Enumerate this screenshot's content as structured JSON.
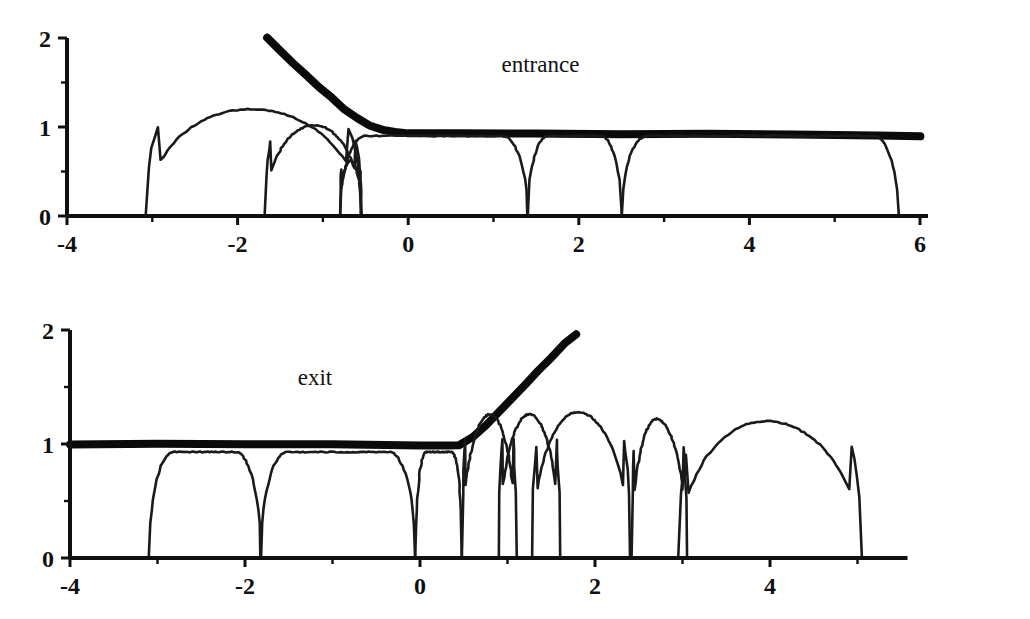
{
  "figure": {
    "background_color": "#ffffff",
    "ink_color": "#101010",
    "width": 1030,
    "height": 619
  },
  "chart_data": [
    {
      "type": "line",
      "title": "",
      "annotation": "entrance",
      "annotation_x": 1.55,
      "annotation_y": 1.62,
      "xlabel": "",
      "ylabel": "",
      "xlim": [
        -4,
        6
      ],
      "ylim": [
        0,
        2
      ],
      "grid": false,
      "legend": "none",
      "xticks": [
        -4,
        -3,
        -2,
        -1,
        0,
        1,
        2,
        3,
        4,
        5,
        6
      ],
      "xticklabels": [
        "-4",
        "",
        "-2",
        "",
        "0",
        "",
        "2",
        "",
        "4",
        "",
        "6"
      ],
      "yticks": [
        0,
        0.5,
        1,
        1.5,
        2
      ],
      "yticklabels": [
        "0",
        "",
        "1",
        "",
        "2"
      ],
      "series": [
        {
          "name": "free-surface-envelope",
          "style": "thick",
          "points": [
            [
              -1.65,
              2.0
            ],
            [
              -1.5,
              1.86
            ],
            [
              -1.35,
              1.72
            ],
            [
              -1.2,
              1.58
            ],
            [
              -1.05,
              1.45
            ],
            [
              -0.9,
              1.33
            ],
            [
              -0.75,
              1.2
            ],
            [
              -0.6,
              1.1
            ],
            [
              -0.45,
              1.02
            ],
            [
              -0.3,
              0.965
            ],
            [
              -0.15,
              0.94
            ],
            [
              0.0,
              0.93
            ],
            [
              0.6,
              0.928
            ],
            [
              1.5,
              0.925
            ],
            [
              2.5,
              0.922
            ],
            [
              3.5,
              0.918
            ],
            [
              4.5,
              0.912
            ],
            [
              5.5,
              0.905
            ],
            [
              6.0,
              0.9
            ]
          ]
        },
        {
          "name": "bubble-1",
          "style": "arc",
          "x_left": -3.08,
          "x_right": -0.55,
          "peak_x": -1.85,
          "peak_y": 1.2
        },
        {
          "name": "bubble-2",
          "style": "arc",
          "x_left": -1.68,
          "x_right": -0.55,
          "peak_x": -1.1,
          "peak_y": 1.02
        },
        {
          "name": "bubble-3",
          "style": "arc",
          "x_left": -0.8,
          "x_right": -0.55,
          "peak_x": -0.68,
          "peak_y": 0.62
        },
        {
          "name": "plateau-1",
          "style": "plateau",
          "x_left": -0.8,
          "x_right": 1.4,
          "top_y": 0.9
        },
        {
          "name": "plateau-2",
          "style": "plateau",
          "x_left": 1.4,
          "x_right": 2.5,
          "top_y": 0.9
        },
        {
          "name": "plateau-3",
          "style": "plateau",
          "x_left": 2.5,
          "x_right": 5.75,
          "top_y": 0.9
        }
      ]
    },
    {
      "type": "line",
      "title": "",
      "annotation": "exit",
      "annotation_x": -1.2,
      "annotation_y": 1.52,
      "xlabel": "",
      "ylabel": "",
      "xlim": [
        -4,
        5.5
      ],
      "ylim": [
        0,
        2
      ],
      "grid": false,
      "legend": "none",
      "xticks": [
        -4,
        -3,
        -2,
        -1,
        0,
        1,
        2,
        3,
        4,
        5
      ],
      "xticklabels": [
        "-4",
        "",
        "-2",
        "",
        "0",
        "",
        "2",
        "",
        "4",
        ""
      ],
      "yticks": [
        0,
        0.5,
        1,
        1.5,
        2
      ],
      "yticklabels": [
        "0",
        "",
        "1",
        "",
        "2"
      ],
      "series": [
        {
          "name": "free-surface-envelope",
          "style": "thick",
          "points": [
            [
              -4.0,
              1.0
            ],
            [
              -3.0,
              1.0
            ],
            [
              -2.0,
              0.998
            ],
            [
              -1.0,
              0.995
            ],
            [
              0.0,
              0.99
            ],
            [
              0.3,
              0.985
            ],
            [
              0.45,
              0.99
            ],
            [
              0.6,
              1.06
            ],
            [
              0.75,
              1.16
            ],
            [
              0.9,
              1.28
            ],
            [
              1.05,
              1.4
            ],
            [
              1.2,
              1.52
            ],
            [
              1.35,
              1.64
            ],
            [
              1.5,
              1.76
            ],
            [
              1.65,
              1.88
            ],
            [
              1.78,
              1.96
            ]
          ]
        },
        {
          "name": "plateau-1",
          "style": "plateau",
          "x_left": -3.1,
          "x_right": -1.82,
          "top_y": 0.93
        },
        {
          "name": "plateau-2",
          "style": "plateau",
          "x_left": -1.82,
          "x_right": -0.05,
          "top_y": 0.93
        },
        {
          "name": "plateau-3",
          "style": "plateau",
          "x_left": -0.05,
          "x_right": 0.48,
          "top_y": 0.93
        },
        {
          "name": "bubble-1",
          "style": "arc",
          "x_left": 0.48,
          "x_right": 1.1,
          "peak_x": 0.8,
          "peak_y": 1.26
        },
        {
          "name": "bubble-2",
          "style": "arc",
          "x_left": 0.9,
          "x_right": 1.6,
          "peak_x": 1.25,
          "peak_y": 1.26
        },
        {
          "name": "bubble-3",
          "style": "arc",
          "x_left": 1.28,
          "x_right": 2.4,
          "peak_x": 1.8,
          "peak_y": 1.28
        },
        {
          "name": "bubble-4",
          "style": "arc",
          "x_left": 2.42,
          "x_right": 3.05,
          "peak_x": 2.7,
          "peak_y": 1.22
        },
        {
          "name": "bubble-5",
          "style": "arc",
          "x_left": 2.95,
          "x_right": 5.05,
          "peak_x": 3.95,
          "peak_y": 1.2
        }
      ]
    }
  ]
}
